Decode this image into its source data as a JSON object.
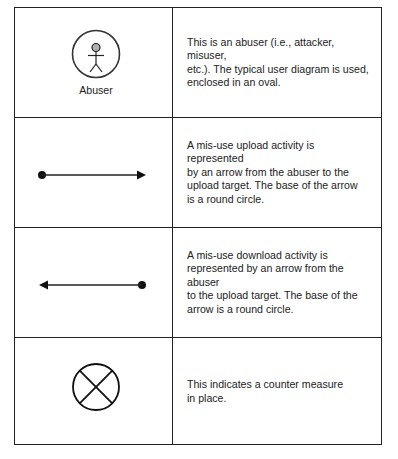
{
  "legend": {
    "rows": [
      {
        "symbol": "abuser-icon",
        "symbol_label": "Abuser",
        "description": "This is an abuser (i.e., attacker, misuser,\netc.). The typical user diagram is used,\nenclosed in an oval."
      },
      {
        "symbol": "upload-arrow-icon",
        "description": "A mis-use upload activity is represented\nby an arrow from the abuser to the\nupload target. The base of the arrow\nis a round circle."
      },
      {
        "symbol": "download-arrow-icon",
        "description": "A mis-use download activity is\nrepresented by an arrow from the abuser\nto the upload target. The base of the\narrow is a round circle."
      },
      {
        "symbol": "counter-measure-icon",
        "description": "This indicates a counter measure\nin place."
      }
    ]
  },
  "colors": {
    "line": "#222222",
    "head_fill": "#b0b0b0",
    "background": "#ffffff"
  }
}
